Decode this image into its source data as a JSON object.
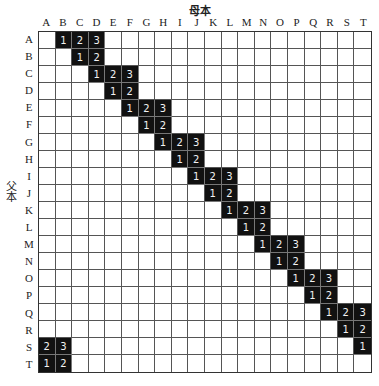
{
  "titles": {
    "top": "母本",
    "side": "父本"
  },
  "columns": [
    "A",
    "B",
    "C",
    "D",
    "E",
    "F",
    "G",
    "H",
    "I",
    "J",
    "K",
    "L",
    "M",
    "N",
    "O",
    "P",
    "Q",
    "R",
    "S",
    "T"
  ],
  "rows": [
    "A",
    "B",
    "C",
    "D",
    "E",
    "F",
    "G",
    "H",
    "I",
    "J",
    "K",
    "L",
    "M",
    "N",
    "O",
    "P",
    "Q",
    "R",
    "S",
    "T"
  ],
  "filled_cells": [
    {
      "row": "A",
      "col": "B",
      "value": "1"
    },
    {
      "row": "A",
      "col": "C",
      "value": "2"
    },
    {
      "row": "A",
      "col": "D",
      "value": "3"
    },
    {
      "row": "B",
      "col": "C",
      "value": "1"
    },
    {
      "row": "B",
      "col": "D",
      "value": "2"
    },
    {
      "row": "C",
      "col": "D",
      "value": "1"
    },
    {
      "row": "C",
      "col": "E",
      "value": "2"
    },
    {
      "row": "C",
      "col": "F",
      "value": "3"
    },
    {
      "row": "D",
      "col": "E",
      "value": "1"
    },
    {
      "row": "D",
      "col": "F",
      "value": "2"
    },
    {
      "row": "E",
      "col": "F",
      "value": "1"
    },
    {
      "row": "E",
      "col": "G",
      "value": "2"
    },
    {
      "row": "E",
      "col": "H",
      "value": "3"
    },
    {
      "row": "F",
      "col": "G",
      "value": "1"
    },
    {
      "row": "F",
      "col": "H",
      "value": "2"
    },
    {
      "row": "G",
      "col": "H",
      "value": "1"
    },
    {
      "row": "G",
      "col": "I",
      "value": "2"
    },
    {
      "row": "G",
      "col": "J",
      "value": "3"
    },
    {
      "row": "H",
      "col": "I",
      "value": "1"
    },
    {
      "row": "H",
      "col": "J",
      "value": "2"
    },
    {
      "row": "I",
      "col": "J",
      "value": "1"
    },
    {
      "row": "I",
      "col": "K",
      "value": "2"
    },
    {
      "row": "I",
      "col": "L",
      "value": "3"
    },
    {
      "row": "J",
      "col": "K",
      "value": "1"
    },
    {
      "row": "J",
      "col": "L",
      "value": "2"
    },
    {
      "row": "K",
      "col": "L",
      "value": "1"
    },
    {
      "row": "K",
      "col": "M",
      "value": "2"
    },
    {
      "row": "K",
      "col": "N",
      "value": "3"
    },
    {
      "row": "L",
      "col": "M",
      "value": "1"
    },
    {
      "row": "L",
      "col": "N",
      "value": "2"
    },
    {
      "row": "M",
      "col": "N",
      "value": "1"
    },
    {
      "row": "M",
      "col": "O",
      "value": "2"
    },
    {
      "row": "M",
      "col": "P",
      "value": "3"
    },
    {
      "row": "N",
      "col": "O",
      "value": "1"
    },
    {
      "row": "N",
      "col": "P",
      "value": "2"
    },
    {
      "row": "O",
      "col": "P",
      "value": "1"
    },
    {
      "row": "O",
      "col": "Q",
      "value": "2"
    },
    {
      "row": "O",
      "col": "R",
      "value": "3"
    },
    {
      "row": "P",
      "col": "Q",
      "value": "1"
    },
    {
      "row": "P",
      "col": "R",
      "value": "2"
    },
    {
      "row": "Q",
      "col": "R",
      "value": "1"
    },
    {
      "row": "Q",
      "col": "S",
      "value": "2"
    },
    {
      "row": "Q",
      "col": "T",
      "value": "3"
    },
    {
      "row": "R",
      "col": "S",
      "value": "1"
    },
    {
      "row": "R",
      "col": "T",
      "value": "2"
    },
    {
      "row": "S",
      "col": "T",
      "value": "1"
    },
    {
      "row": "S",
      "col": "A",
      "value": "2"
    },
    {
      "row": "S",
      "col": "B",
      "value": "3"
    },
    {
      "row": "T",
      "col": "A",
      "value": "1"
    },
    {
      "row": "T",
      "col": "B",
      "value": "2"
    }
  ],
  "colors": {
    "filled": "#111111",
    "filled_text": "#f2f2f2",
    "grid_line": "#555555"
  }
}
